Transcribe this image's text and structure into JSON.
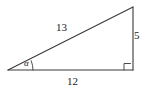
{
  "figure": {
    "type": "right-triangle-diagram",
    "stroke_color": "#3a3a3a",
    "text_color": "#1a1a1a",
    "background_color": "#ffffff",
    "labels": {
      "hypotenuse": "13",
      "opposite": "5",
      "adjacent": "12",
      "angle": "α"
    },
    "markers": {
      "right_angle": "right-angle-square",
      "angle_arc": "angle-arc"
    },
    "vertices": {
      "left": [
        8,
        70
      ],
      "bottom_right": [
        133,
        70
      ],
      "top_right": [
        133,
        7
      ]
    }
  }
}
